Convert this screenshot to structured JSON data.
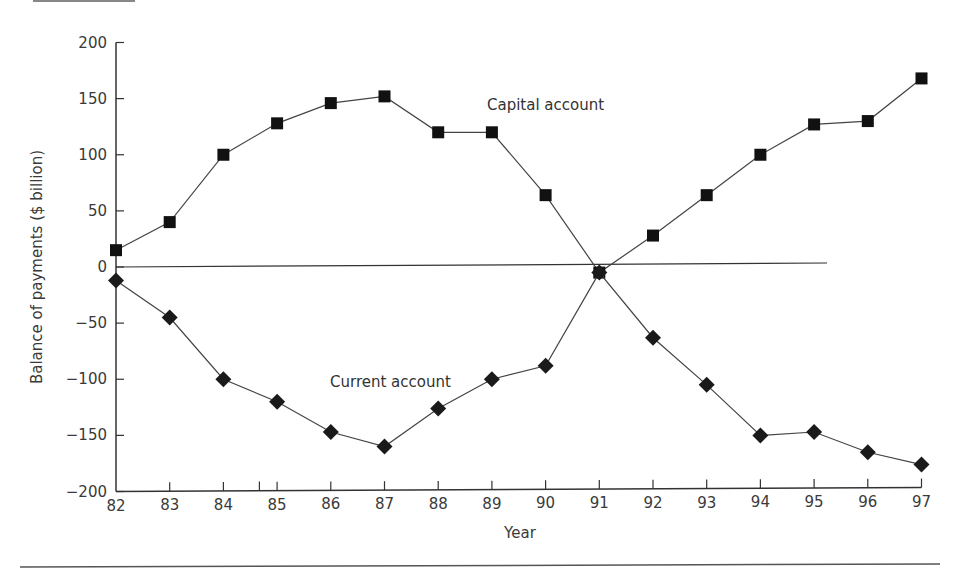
{
  "chart_data": {
    "type": "line",
    "title": "",
    "xlabel": "Year",
    "ylabel": "Balance of payments ($ billion)",
    "ylim": [
      -200,
      200
    ],
    "yticks": [
      200,
      150,
      100,
      50,
      0,
      -50,
      -100,
      -150,
      -200
    ],
    "categories": [
      "82",
      "83",
      "84",
      "85",
      "86",
      "87",
      "88",
      "89",
      "90",
      "91",
      "92",
      "93",
      "94",
      "95",
      "96",
      "97"
    ],
    "grid": false,
    "legend": "none (inline annotations)",
    "series": [
      {
        "name": "Capital account",
        "marker": "square",
        "values": [
          15,
          40,
          100,
          128,
          146,
          152,
          120,
          120,
          64,
          -5,
          28,
          64,
          100,
          127,
          130,
          168
        ]
      },
      {
        "name": "Current account",
        "marker": "diamond",
        "values": [
          -12,
          -45,
          -100,
          -120,
          -147,
          -160,
          -126,
          -100,
          -88,
          -5,
          -63,
          -105,
          -150,
          -147,
          -165,
          -176
        ]
      }
    ],
    "annotations": [
      {
        "text": "Capital account",
        "near": "88-90, ~145"
      },
      {
        "text": "Current account",
        "near": "87-89, ~-105"
      }
    ],
    "zero_line": {
      "from": "82",
      "to": "~95.2"
    }
  },
  "labels": {
    "xlabel": "Year",
    "ylabel": "Balance of payments ($ billion)",
    "capital": "Capital account",
    "current": "Current account"
  }
}
